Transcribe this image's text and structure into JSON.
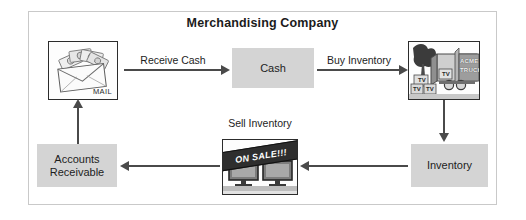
{
  "diagram": {
    "title": "Merchandising Company",
    "type": "operating-cycle-flow-diagram",
    "nodes": [
      {
        "id": "mail",
        "label": "MAIL",
        "kind": "image-box",
        "icon": "envelope-with-cash-icon"
      },
      {
        "id": "cash",
        "label": "Cash",
        "kind": "gray-box"
      },
      {
        "id": "truck",
        "label_line1": "ACME",
        "label_line2": "TRUCKING",
        "kind": "image-box",
        "icon": "delivery-truck-icon"
      },
      {
        "id": "inventory",
        "label": "Inventory",
        "kind": "gray-box"
      },
      {
        "id": "tvs",
        "label": "ON SALE!!!",
        "kind": "image-box",
        "icon": "televisions-on-sale-icon"
      },
      {
        "id": "ar",
        "label_line1": "Accounts",
        "label_line2": "Receivable",
        "kind": "gray-box"
      }
    ],
    "edges": [
      {
        "id": "mail-to-cash",
        "label": "Receive Cash",
        "direction": "right"
      },
      {
        "id": "cash-to-truck",
        "label": "Buy Inventory",
        "direction": "right"
      },
      {
        "id": "truck-to-inventory",
        "label": "",
        "direction": "down"
      },
      {
        "id": "inventory-to-tvs",
        "label": "",
        "direction": "left"
      },
      {
        "id": "tvs-to-ar",
        "label": "Sell Inventory",
        "direction": "left"
      },
      {
        "id": "ar-to-mail",
        "label": "",
        "direction": "up"
      }
    ],
    "tv_box_labels": [
      "TV",
      "TV",
      "TV",
      "TV"
    ],
    "colors": {
      "node_fill": "#d4d4d4",
      "arrow": "#4a4a4a",
      "frame_border": "#c9c9c9",
      "text": "#1d1d1d",
      "banner_bg": "#2e2e2e",
      "banner_text": "#ffffff"
    }
  }
}
